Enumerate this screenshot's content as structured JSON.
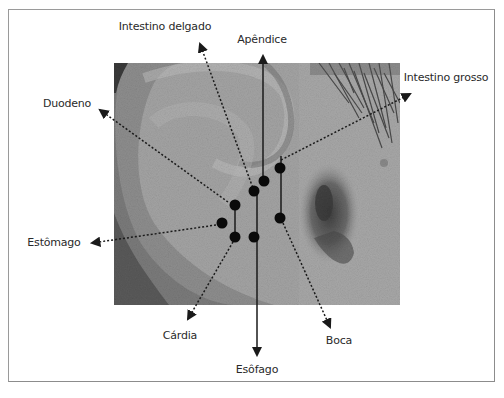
{
  "figure": {
    "colors": {
      "frame_border": "#9a9a9a",
      "line": "#1a1a1a",
      "dot": "#0a0a0a",
      "label_text": "#2a2a2a",
      "photo_base": "#9c9c9c"
    },
    "labels": {
      "intestino_delgado": "Intestino delgado",
      "apendice": "Apêndice",
      "intestino_grosso": "Intestino grosso",
      "duodeno": "Duodeno",
      "estomago": "Estômago",
      "cardia": "Cárdia",
      "boca": "Boca",
      "esofago": "Esôfago"
    },
    "points": [
      {
        "name": "Apêndice",
        "x": 264,
        "y": 181,
        "leader": "solid",
        "arrow_tip": [
          263,
          52
        ]
      },
      {
        "name": "Intestino delgado",
        "x": 254,
        "y": 191,
        "leader": "dotted",
        "arrow_tip": [
          198,
          40
        ]
      },
      {
        "name": "Intestino grosso",
        "x": 280,
        "y": 168,
        "leader": "dotted",
        "arrow_tip": [
          414,
          92
        ]
      },
      {
        "name": "Duodeno",
        "x": 235,
        "y": 205,
        "leader": "dotted",
        "arrow_tip": [
          96,
          107
        ]
      },
      {
        "name": "Estômago",
        "x": 222,
        "y": 223,
        "leader": "dotted",
        "arrow_tip": [
          88,
          243
        ]
      },
      {
        "name": "Cárdia",
        "x": 235,
        "y": 237,
        "leader": "dotted",
        "arrow_tip": [
          186,
          323
        ]
      },
      {
        "name": "Esôfago",
        "x": 254,
        "y": 237,
        "leader": "solid",
        "arrow_tip": [
          257,
          358
        ]
      },
      {
        "name": "Boca",
        "x": 280,
        "y": 218,
        "leader": "dotted",
        "arrow_tip": [
          332,
          331
        ]
      }
    ]
  }
}
